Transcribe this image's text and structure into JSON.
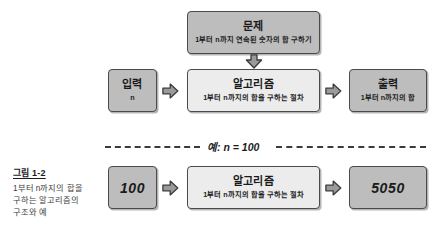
{
  "figure": {
    "caption_label": "그림 1-2",
    "caption_text": "1부터 n까지의 합을 구하는 알고리즘의 구조와 예",
    "example_label": "예: n = 100",
    "colors": {
      "box_fill_dark": "#bdbdbd",
      "box_fill_light": "#ececec",
      "box_border": "#4a4a4a",
      "arrow_fill": "#9a9a9a",
      "arrow_border": "#3a3a3a",
      "text": "#1a1a1a",
      "background": "#ffffff"
    }
  },
  "problem": {
    "title": "문제",
    "subtitle": "1부터 n까지 연속된 숫자의 합 구하기"
  },
  "flow": {
    "input": {
      "title": "입력",
      "subtitle": "n"
    },
    "algorithm": {
      "title": "알고리즘",
      "subtitle": "1부터 n까지의 합을 구하는 절차"
    },
    "output": {
      "title": "출력",
      "subtitle": "1부터 n까지의 합"
    }
  },
  "example": {
    "input_value": "100",
    "algorithm": {
      "title": "알고리즘",
      "subtitle": "1부터 n까지의 합을 구하는 절차"
    },
    "output_value": "5050"
  },
  "arrows": {
    "problem_to_algorithm": "arrow-down-icon",
    "input_to_algorithm": "arrow-right-icon",
    "algorithm_to_output": "arrow-right-icon",
    "example_input_to_algorithm": "arrow-right-icon",
    "example_algorithm_to_output": "arrow-right-icon"
  }
}
